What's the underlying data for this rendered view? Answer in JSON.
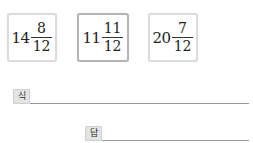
{
  "choices": [
    {
      "whole": "14",
      "numerator": "8",
      "denominator": "12",
      "selected": false
    },
    {
      "whole": "11",
      "numerator": "11",
      "denominator": "12",
      "selected": true
    },
    {
      "whole": "20",
      "numerator": "7",
      "denominator": "12",
      "selected": false
    }
  ],
  "formula": {
    "label": "식"
  },
  "answer": {
    "label": "답"
  }
}
